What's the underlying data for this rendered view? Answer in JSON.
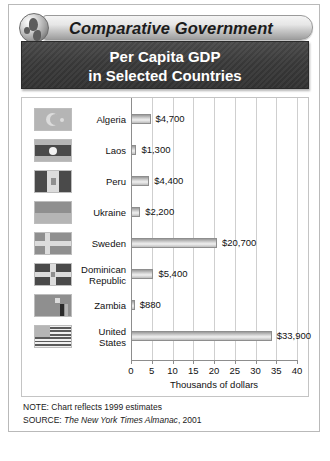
{
  "banner": {
    "series_title": "Comparative Government",
    "globe_icon": "globe-icon"
  },
  "title": {
    "line1": "Per Capita GDP",
    "line2": "in Selected Countries"
  },
  "chart_data": {
    "type": "bar",
    "orientation": "horizontal",
    "title": "Per Capita GDP in Selected Countries",
    "xlabel": "Thousands of dollars",
    "ylabel": "",
    "xlim": [
      0,
      40
    ],
    "xticks": [
      0,
      5,
      10,
      15,
      20,
      25,
      30,
      35,
      40
    ],
    "grid": true,
    "legend": "none",
    "categories": [
      "Algeria",
      "Laos",
      "Peru",
      "Ukraine",
      "Sweden",
      "Dominican Republic",
      "Zambia",
      "United States"
    ],
    "values": [
      4700,
      1300,
      4400,
      2200,
      20700,
      5400,
      880,
      33900
    ],
    "value_labels": [
      "$4,700",
      "$1,300",
      "$4,400",
      "$2,200",
      "$20,700",
      "$5,400",
      "$880",
      "$33,900"
    ],
    "units": "US dollars"
  },
  "rows": [
    {
      "country": "Algeria",
      "label_lines": [
        "Algeria"
      ],
      "value_label": "$4,700",
      "value": 4700,
      "flag_icon": "flag-algeria-icon"
    },
    {
      "country": "Laos",
      "label_lines": [
        "Laos"
      ],
      "value_label": "$1,300",
      "value": 1300,
      "flag_icon": "flag-laos-icon"
    },
    {
      "country": "Peru",
      "label_lines": [
        "Peru"
      ],
      "value_label": "$4,400",
      "value": 4400,
      "flag_icon": "flag-peru-icon"
    },
    {
      "country": "Ukraine",
      "label_lines": [
        "Ukraine"
      ],
      "value_label": "$2,200",
      "value": 2200,
      "flag_icon": "flag-ukraine-icon"
    },
    {
      "country": "Sweden",
      "label_lines": [
        "Sweden"
      ],
      "value_label": "$20,700",
      "value": 20700,
      "flag_icon": "flag-sweden-icon"
    },
    {
      "country": "Dominican Republic",
      "label_lines": [
        "Dominican",
        "Republic"
      ],
      "value_label": "$5,400",
      "value": 5400,
      "flag_icon": "flag-dominican-republic-icon"
    },
    {
      "country": "Zambia",
      "label_lines": [
        "Zambia"
      ],
      "value_label": "$880",
      "value": 880,
      "flag_icon": "flag-zambia-icon"
    },
    {
      "country": "United States",
      "label_lines": [
        "United",
        "States"
      ],
      "value_label": "$33,900",
      "value": 33900,
      "flag_icon": "flag-united-states-icon"
    }
  ],
  "axis": {
    "ticks": [
      "0",
      "5",
      "10",
      "15",
      "20",
      "25",
      "30",
      "35",
      "40"
    ],
    "title": "Thousands of dollars"
  },
  "notes": {
    "note_label": "NOTE:",
    "note_text": " Chart reflects 1999 estimates",
    "source_label": "SOURCE:",
    "source_italic": " The New York Times Almanac",
    "source_tail": ", 2001"
  },
  "colors": {
    "title_block_bg": "#3b3b3b",
    "banner_plate": "#d8d8d8",
    "bar_fill": "#d6d6d6",
    "grid": "#cfcfcf",
    "axis": "#8d8d8d",
    "text": "#111111"
  }
}
